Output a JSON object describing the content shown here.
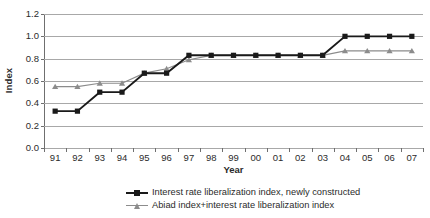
{
  "chart_data": {
    "type": "line",
    "title": "",
    "xlabel": "Year",
    "ylabel": "Index",
    "categories": [
      "91",
      "92",
      "93",
      "94",
      "95",
      "96",
      "97",
      "98",
      "99",
      "00",
      "01",
      "02",
      "03",
      "04",
      "05",
      "06",
      "07"
    ],
    "ylim": [
      0.0,
      1.2
    ],
    "ytick_step": 0.2,
    "yticks": [
      "0.0",
      "0.2",
      "0.4",
      "0.6",
      "0.8",
      "1.0",
      "1.2"
    ],
    "ytick_values": [
      0.0,
      0.2,
      0.4,
      0.6,
      0.8,
      1.0,
      1.2
    ],
    "grid": "horizontal",
    "legend_position": "bottom",
    "series": [
      {
        "name": "Interest rate liberalization index, newly constructed",
        "color": "#1a1a1a",
        "marker": "square",
        "values": [
          0.33,
          0.33,
          0.5,
          0.5,
          0.67,
          0.67,
          0.83,
          0.83,
          0.83,
          0.83,
          0.83,
          0.83,
          0.83,
          1.0,
          1.0,
          1.0,
          1.0
        ]
      },
      {
        "name": "Abiad index+interest rate liberalization index",
        "color": "#8c8c8c",
        "marker": "triangle",
        "values": [
          0.55,
          0.55,
          0.58,
          0.58,
          0.67,
          0.71,
          0.79,
          0.83,
          0.83,
          0.83,
          0.83,
          0.83,
          0.83,
          0.87,
          0.87,
          0.87,
          0.87
        ]
      }
    ]
  },
  "colors": {
    "series_1": "#1a1a1a",
    "series_2": "#8c8c8c",
    "gridline": "#a8a8a8",
    "axis": "#6f6f6f",
    "text": "#2b2b2b",
    "background": "#ffffff"
  },
  "legend": {
    "entries": [
      {
        "label": "Interest rate liberalization index, newly constructed"
      },
      {
        "label": "Abiad index+interest rate liberalization index"
      }
    ]
  }
}
